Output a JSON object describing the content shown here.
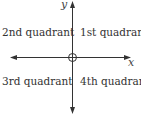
{
  "diagram": {
    "axes": {
      "x_label": "x",
      "y_label": "y"
    },
    "quadrants": {
      "q1": "1st quadrant",
      "q2": "2nd quadrant",
      "q3": "3rd quadrant",
      "q4": "4th quadrant"
    },
    "origin_symbol": "origin-circle",
    "colors": {
      "axis": "#333333",
      "text": "#333333"
    }
  }
}
